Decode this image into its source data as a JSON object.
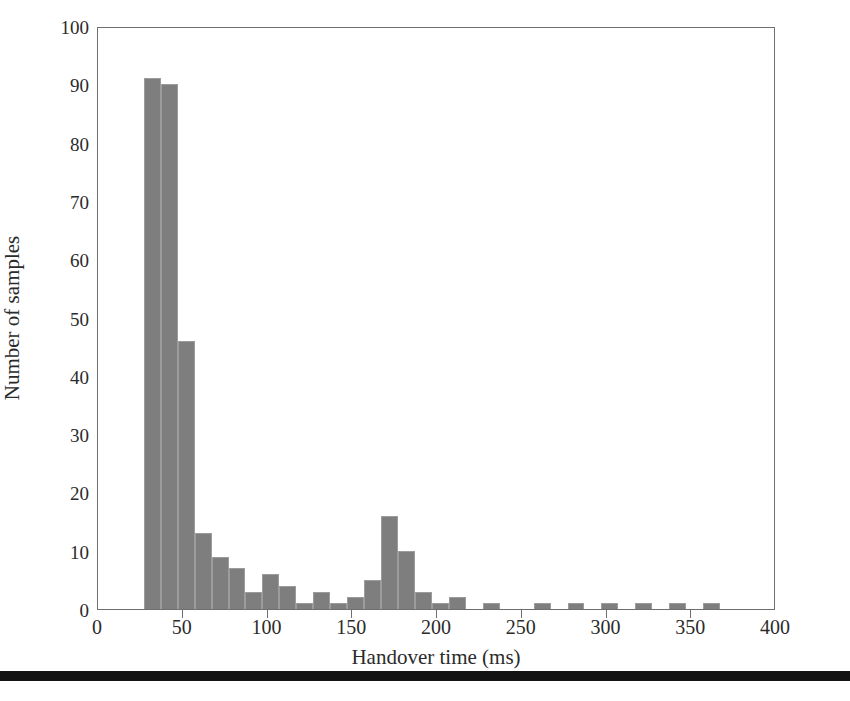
{
  "chart_data": {
    "type": "bar",
    "title": "",
    "subtitle": "",
    "xlabel": "Handover time (ms)",
    "ylabel": "Number of samples",
    "xlim": [
      0,
      400
    ],
    "ylim": [
      0,
      100
    ],
    "xticks": [
      0,
      50,
      100,
      150,
      200,
      250,
      300,
      350,
      400
    ],
    "yticks": [
      0,
      10,
      20,
      30,
      40,
      50,
      60,
      70,
      80,
      90,
      100
    ],
    "grid": false,
    "legend": null,
    "bin_width": 10,
    "bar_color": "#7e7e7e",
    "bar_edge_color": "#9c9c9c",
    "axis_color": "#6f6f6f",
    "bin_centers": [
      32,
      42,
      52,
      62,
      72,
      82,
      92,
      102,
      112,
      122,
      132,
      142,
      152,
      162,
      172,
      182,
      192,
      202,
      212,
      222,
      232,
      242,
      252,
      262,
      272,
      282,
      292,
      302,
      312,
      322,
      332,
      342,
      352,
      362
    ],
    "values": [
      91,
      90,
      46,
      13,
      9,
      7,
      3,
      6,
      4,
      1,
      3,
      1,
      2,
      5,
      16,
      10,
      3,
      1,
      2,
      0,
      1,
      0,
      0,
      1,
      0,
      1,
      0,
      1,
      0,
      1,
      0,
      1,
      0,
      1
    ],
    "categories": [
      "32",
      "42",
      "52",
      "62",
      "72",
      "82",
      "92",
      "102",
      "112",
      "122",
      "132",
      "142",
      "152",
      "162",
      "172",
      "182",
      "192",
      "202",
      "212",
      "222",
      "232",
      "242",
      "252",
      "262",
      "272",
      "282",
      "292",
      "302",
      "312",
      "322",
      "332",
      "342",
      "352",
      "362"
    ],
    "annotations": []
  },
  "figure": {
    "bottom_rule_color": "#131313",
    "background": "#ffffff"
  }
}
